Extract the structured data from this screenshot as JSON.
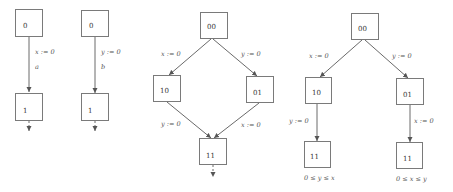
{
  "diagrams": [
    {
      "id": "a",
      "nodes": [
        {
          "label": "0"
        },
        {
          "label": "1"
        }
      ],
      "edges": [
        {
          "label": "x := 0",
          "action": "a"
        }
      ]
    },
    {
      "id": "b",
      "nodes": [
        {
          "label": "0"
        },
        {
          "label": "1"
        }
      ],
      "edges": [
        {
          "label": "y := 0",
          "action": "b"
        }
      ]
    },
    {
      "id": "c",
      "nodes": [
        {
          "label": "00"
        },
        {
          "label": "10"
        },
        {
          "label": "01"
        },
        {
          "label": "11"
        }
      ],
      "edges": [
        {
          "label": "x := 0"
        },
        {
          "label": "y := 0"
        },
        {
          "label": "y := 0"
        },
        {
          "label": "x := 0"
        }
      ]
    },
    {
      "id": "d",
      "nodes": [
        {
          "label": "00"
        },
        {
          "label": "10"
        },
        {
          "label": "01"
        },
        {
          "label": "11"
        },
        {
          "label": "11"
        }
      ],
      "edges": [
        {
          "label": "x := 0"
        },
        {
          "label": "y := 0"
        },
        {
          "label": "y := 0"
        },
        {
          "label": "x := 0"
        }
      ],
      "conditions": [
        {
          "label": "0 ≤ y ≤ x"
        },
        {
          "label": "0 ≤ x ≤ y"
        }
      ]
    }
  ],
  "colors": {
    "box_stroke": "#7a7a7a",
    "edge_stroke": "#6a6a6a",
    "text": "#333333"
  }
}
